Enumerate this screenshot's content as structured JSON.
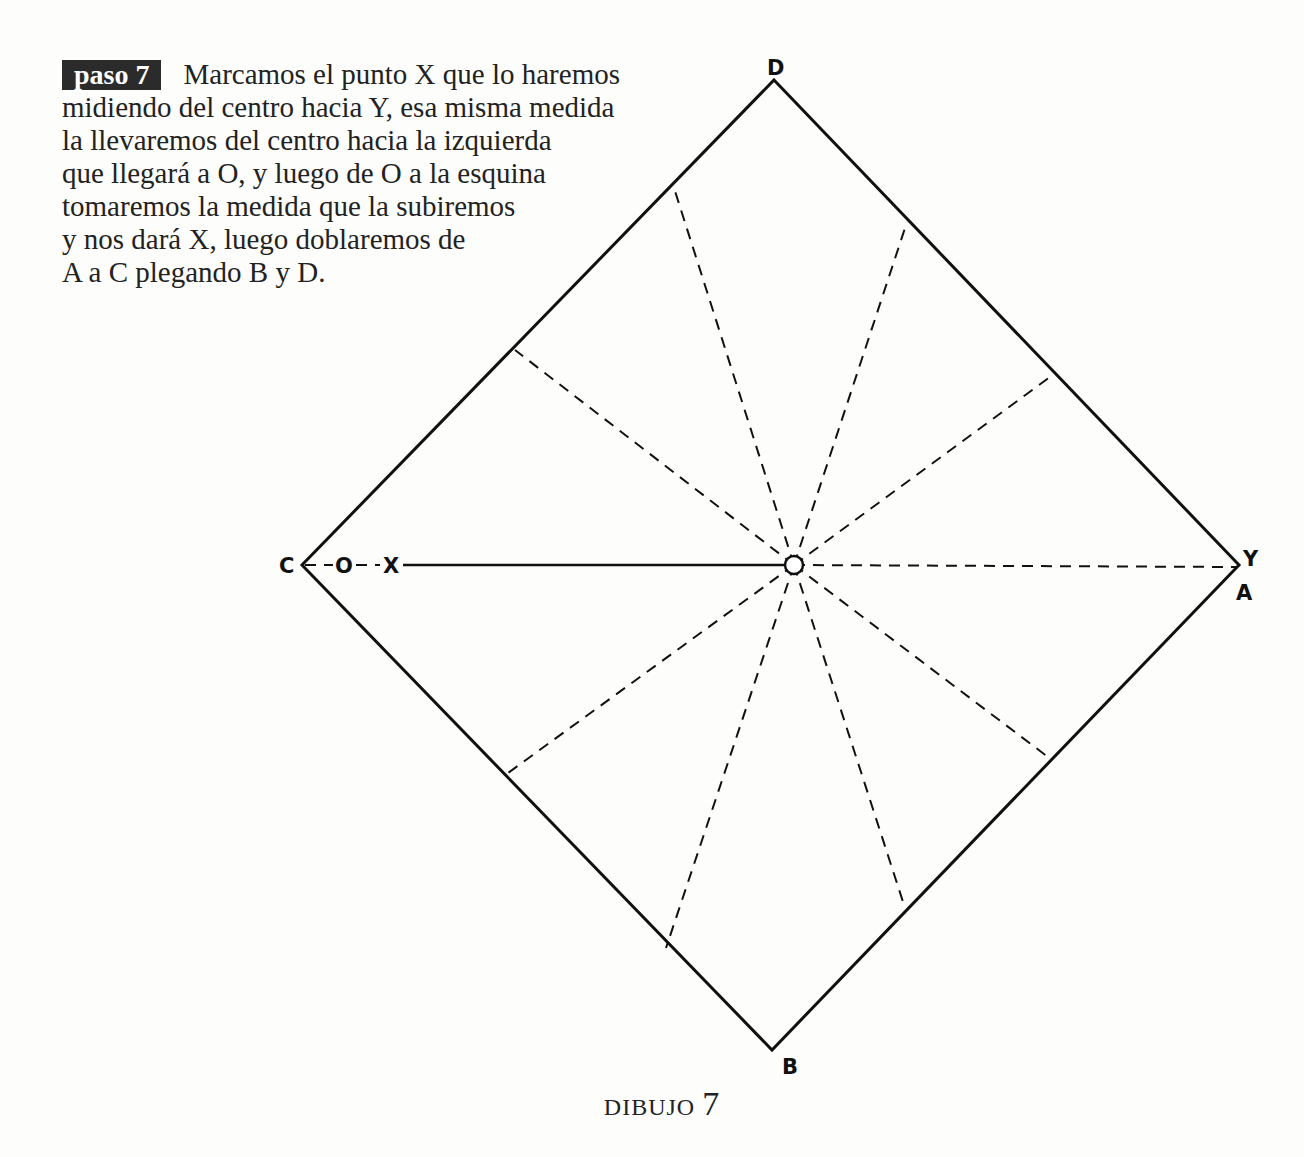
{
  "step": {
    "badge": "paso 7",
    "lines": [
      "Marcamos el punto X que lo haremos",
      "midiendo del centro hacia Y, esa misma medida",
      "la llevaremos del centro hacia la izquierda",
      "que llegará a O, y luego de O a la esquina",
      "tomaremos la medida que la subiremos",
      "y nos dará X, luego doblaremos de",
      "A a C plegando B y D."
    ]
  },
  "diagram": {
    "labels": {
      "top": "D",
      "bottom": "B",
      "left": "C",
      "right_upper": "Y",
      "right_lower": "A",
      "point_o": "O",
      "point_x": "X"
    },
    "line_color": "#111111"
  },
  "caption": {
    "text": "DIBUJO",
    "number": "7"
  }
}
